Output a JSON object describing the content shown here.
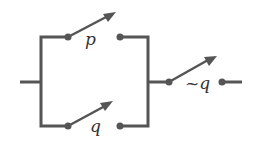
{
  "diagram": {
    "type": "switching-circuit",
    "switches": [
      {
        "id": "top",
        "label": "p"
      },
      {
        "id": "bottom",
        "label": "q"
      },
      {
        "id": "series",
        "label": "~q"
      }
    ],
    "colors": {
      "wire": "#555555",
      "label": "#333333"
    }
  }
}
